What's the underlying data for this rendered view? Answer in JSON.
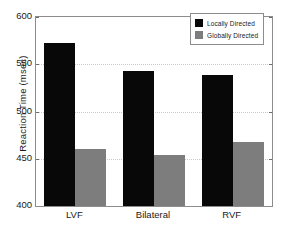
{
  "chart_data": {
    "type": "bar",
    "title": "",
    "xlabel": "",
    "ylabel": "Reaction Time (msec)",
    "categories": [
      "LVF",
      "Bilateral",
      "RVF"
    ],
    "series": [
      {
        "name": "Locally  Directed",
        "values": [
          572,
          543,
          539
        ],
        "color": "#080808"
      },
      {
        "name": "Globally Directed",
        "values": [
          460,
          454,
          468
        ],
        "color": "#7d7d7d"
      }
    ],
    "ylim": [
      400,
      600
    ],
    "yticks": [
      400,
      450,
      500,
      550,
      600
    ],
    "ytick_labels": [
      "400",
      "450",
      "500",
      "550",
      "600"
    ],
    "grid": true,
    "grid_axis": "y",
    "legend_position": "top-right"
  },
  "legend": {
    "items": [
      {
        "label": "Locally  Directed",
        "swatch": "dark"
      },
      {
        "label": "Globally Directed",
        "swatch": "light"
      }
    ]
  }
}
